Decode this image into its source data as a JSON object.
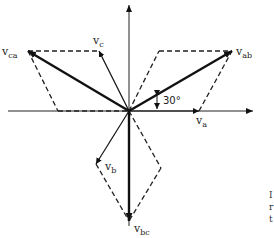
{
  "diagram": {
    "axes": {
      "horizontal": "real-axis",
      "vertical": "imaginary-axis"
    },
    "phase_vectors": [
      {
        "name": "v",
        "sub": "a"
      },
      {
        "name": "v",
        "sub": "b"
      },
      {
        "name": "v",
        "sub": "c"
      }
    ],
    "line_vectors": [
      {
        "name": "v",
        "sub": "ab"
      },
      {
        "name": "v",
        "sub": "bc"
      },
      {
        "name": "v",
        "sub": "ca"
      }
    ],
    "angle_label": "30°",
    "cut_off_text": [
      "I",
      "r",
      "t"
    ]
  }
}
